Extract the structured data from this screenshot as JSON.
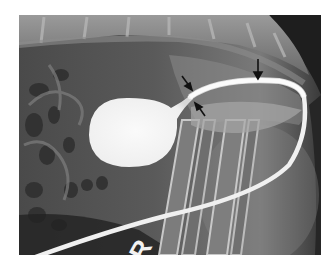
{
  "image": {
    "type": "radiograph",
    "description": "Lateral contrast radiograph showing a contrast-filled urinary bladder and a looping urethral catheter, with three black arrows indicating the urethra",
    "marker_label": "R",
    "arrows": [
      {
        "id": "arrow-1",
        "direction": "down-right"
      },
      {
        "id": "arrow-2",
        "direction": "up-left"
      },
      {
        "id": "arrow-3",
        "direction": "down"
      }
    ],
    "colors": {
      "background": "#5e5e5e",
      "contrast": "#f5f5f5",
      "arrow": "#111111",
      "page": "#ffffff"
    }
  }
}
